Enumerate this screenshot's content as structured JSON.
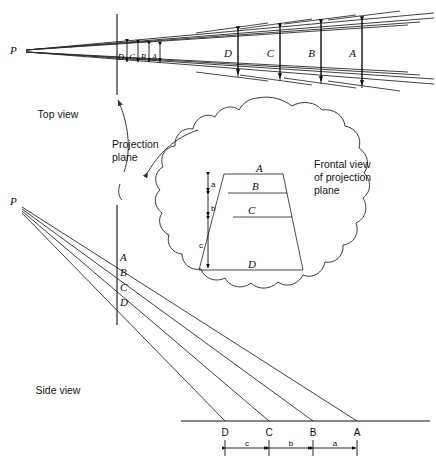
{
  "figure": {
    "captions": {
      "top_view": "Top view",
      "side_view": "Side view",
      "projection_plane": "Projection\nplane",
      "projection_plane_line1": "Projection",
      "projection_plane_line2": "plane",
      "frontal_view_line1": "Frontal view",
      "frontal_view_line2": "of projection",
      "frontal_view_line3": "plane"
    },
    "station_point_label": "P",
    "top_view": {
      "station_point_label": "P",
      "near_plane_labels": [
        "D",
        "C",
        "B",
        "A"
      ],
      "far_dimension_labels": [
        "D",
        "C",
        "B",
        "A"
      ]
    },
    "side_view": {
      "station_point_label": "P",
      "plane_intercept_labels": [
        "A",
        "B",
        "C",
        "D"
      ],
      "ground_point_labels": [
        "D",
        "C",
        "B",
        "A"
      ],
      "ground_spacing_labels": [
        "c",
        "b",
        "a"
      ]
    },
    "frontal_view": {
      "band_labels": [
        "A",
        "B",
        "C",
        "D"
      ],
      "height_labels": [
        "a",
        "b",
        "c"
      ]
    },
    "colors": {
      "line": "#1a1a1a",
      "ray": "#2a2a2a",
      "blob": "#3a3a3a",
      "text": "#0d0d0d",
      "background": "#ffffff"
    }
  }
}
